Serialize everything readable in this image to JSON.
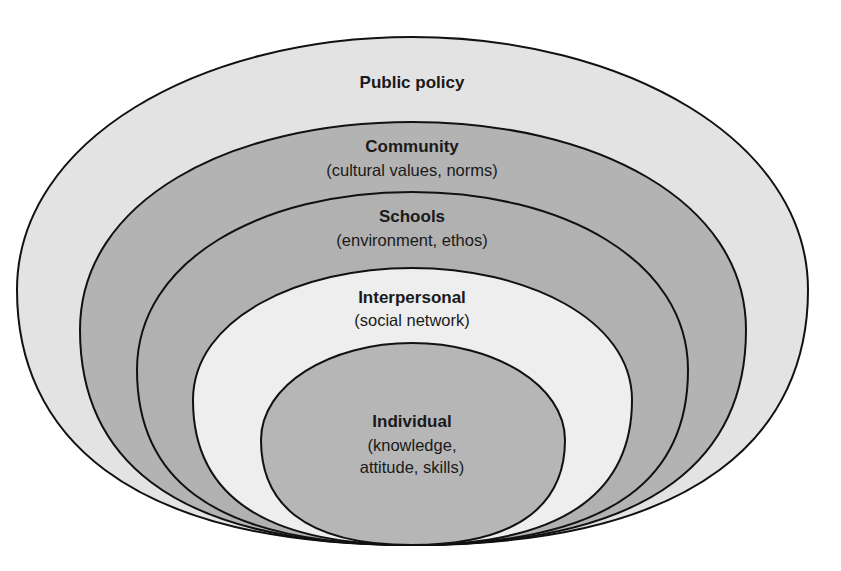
{
  "diagram": {
    "type": "nested-ellipses",
    "colors": {
      "stroke": "#111111",
      "light": "#e3e3e3",
      "medium": "#b3b3b3",
      "white_ish": "#eeeeee",
      "inner": "#b6b6b6"
    },
    "layers": [
      {
        "name": "Public policy",
        "subtitle": ""
      },
      {
        "name": "Community",
        "subtitle": "(cultural values, norms)"
      },
      {
        "name": "Schools",
        "subtitle": "(environment, ethos)"
      },
      {
        "name": "Interpersonal",
        "subtitle": "(social network)"
      },
      {
        "name": "Individual",
        "subtitle_line1": "(knowledge,",
        "subtitle_line2": "attitude, skills)"
      }
    ]
  }
}
